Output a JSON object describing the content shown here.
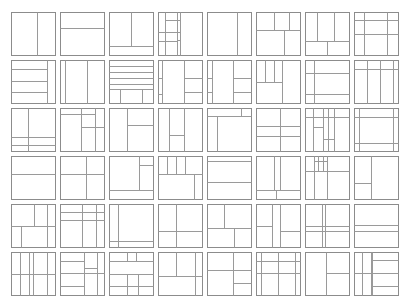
{
  "layout": {
    "cols": 8,
    "rows": 6,
    "origin_x": 11,
    "origin_y": 12,
    "pitch_x": 49,
    "pitch_y": 48,
    "tile_w": 44,
    "tile_h": 43
  },
  "style": {
    "line_color": "#9a9a9a",
    "border_color": "#8c8c8c",
    "background": "#ffffff"
  },
  "tiles": [
    {
      "lines": [
        [
          "v",
          0.58,
          0,
          1
        ]
      ]
    },
    {
      "lines": [
        [
          "h",
          0.38,
          0,
          1
        ]
      ]
    },
    {
      "lines": [
        [
          "v",
          0.5,
          0,
          0.78
        ],
        [
          "h",
          0.78,
          0,
          1
        ]
      ]
    },
    {
      "lines": [
        [
          "v",
          0.15,
          0,
          1
        ],
        [
          "v",
          0.43,
          0,
          1
        ],
        [
          "v",
          0.51,
          0,
          1
        ],
        [
          "h",
          0.18,
          0.15,
          0.51
        ],
        [
          "h",
          0.47,
          0,
          0.51
        ],
        [
          "h",
          0.68,
          0,
          0.43
        ],
        [
          "h",
          0.65,
          0.43,
          0.51
        ]
      ]
    },
    {
      "lines": [
        [
          "v",
          0.68,
          0,
          1
        ]
      ]
    },
    {
      "lines": [
        [
          "h",
          0.42,
          0,
          1
        ],
        [
          "v",
          0.4,
          0,
          0.42
        ],
        [
          "v",
          0.75,
          0,
          0.42
        ],
        [
          "v",
          0.63,
          0.42,
          1
        ]
      ]
    },
    {
      "lines": [
        [
          "v",
          0.28,
          0,
          0.68
        ],
        [
          "v",
          0.67,
          0,
          0.68
        ],
        [
          "h",
          0.68,
          0,
          1
        ],
        [
          "v",
          0.5,
          0.68,
          1
        ]
      ]
    },
    {
      "lines": [
        [
          "h",
          0.18,
          0,
          1
        ],
        [
          "h",
          0.52,
          0,
          1
        ],
        [
          "v",
          0.22,
          0,
          1
        ],
        [
          "v",
          0.74,
          0,
          1
        ]
      ]
    },
    {
      "lines": [
        [
          "h",
          0.22,
          0,
          0.82
        ],
        [
          "h",
          0.48,
          0,
          0.82
        ],
        [
          "h",
          0.75,
          0,
          0.82
        ],
        [
          "v",
          0.82,
          0,
          1
        ]
      ]
    },
    {
      "lines": [
        [
          "v",
          0.12,
          0,
          1
        ],
        [
          "v",
          0.62,
          0,
          1
        ]
      ]
    },
    {
      "lines": [
        [
          "h",
          0.14,
          0,
          1
        ],
        [
          "h",
          0.28,
          0,
          1
        ],
        [
          "h",
          0.42,
          0,
          1
        ],
        [
          "h",
          0.56,
          0,
          1
        ],
        [
          "h",
          0.68,
          0,
          1
        ],
        [
          "v",
          0.24,
          0.68,
          1
        ],
        [
          "v",
          0.76,
          0.68,
          1
        ]
      ]
    },
    {
      "lines": [
        [
          "v",
          0.1,
          0,
          1
        ],
        [
          "v",
          0.58,
          0,
          1
        ],
        [
          "h",
          0.42,
          0.58,
          1
        ],
        [
          "h",
          0.75,
          0.58,
          1
        ],
        [
          "h",
          0.78,
          0,
          0.1
        ],
        [
          "h",
          0.42,
          0,
          0.1
        ]
      ]
    },
    {
      "lines": [
        [
          "v",
          0.12,
          0,
          1
        ],
        [
          "v",
          0.58,
          0,
          1
        ],
        [
          "h",
          0.42,
          0.58,
          1
        ],
        [
          "h",
          0.75,
          0.58,
          1
        ],
        [
          "h",
          0.42,
          0,
          0.12
        ],
        [
          "h",
          0.75,
          0,
          0.12
        ]
      ]
    },
    {
      "lines": [
        [
          "v",
          0.2,
          0,
          0.5
        ],
        [
          "v",
          0.4,
          0,
          0.5
        ],
        [
          "v",
          0.6,
          0,
          0.5
        ],
        [
          "h",
          0.5,
          0,
          0.6
        ],
        [
          "v",
          0.6,
          0,
          1
        ]
      ]
    },
    {
      "lines": [
        [
          "v",
          0.2,
          0,
          1
        ],
        [
          "h",
          0.3,
          0,
          1
        ],
        [
          "h",
          0.78,
          0,
          1
        ]
      ]
    },
    {
      "lines": [
        [
          "v",
          0.3,
          0,
          1
        ],
        [
          "v",
          0.58,
          0,
          1
        ],
        [
          "v",
          0.88,
          0,
          1
        ],
        [
          "h",
          0.22,
          0,
          1
        ]
      ]
    },
    {
      "lines": [
        [
          "v",
          0.38,
          0,
          1
        ],
        [
          "h",
          0.68,
          0,
          1
        ],
        [
          "h",
          0.86,
          0,
          1
        ]
      ]
    },
    {
      "lines": [
        [
          "v",
          0.48,
          0,
          1
        ],
        [
          "v",
          0.8,
          0,
          1
        ],
        [
          "h",
          0.15,
          0,
          0.8
        ],
        [
          "h",
          0.45,
          0.48,
          1
        ]
      ]
    },
    {
      "lines": [
        [
          "v",
          0.4,
          0,
          1
        ],
        [
          "h",
          0.4,
          0.4,
          1
        ]
      ]
    },
    {
      "lines": [
        [
          "v",
          0.25,
          0,
          1
        ],
        [
          "v",
          0.6,
          0,
          1
        ],
        [
          "h",
          0.62,
          0.25,
          0.6
        ]
      ]
    },
    {
      "lines": [
        [
          "v",
          0.22,
          0.18,
          1
        ],
        [
          "h",
          0.18,
          0,
          1
        ],
        [
          "v",
          0.78,
          0,
          0.18
        ]
      ]
    },
    {
      "lines": [
        [
          "v",
          0.55,
          0,
          1
        ],
        [
          "h",
          0.42,
          0,
          1
        ],
        [
          "h",
          0.65,
          0,
          1
        ]
      ]
    },
    {
      "lines": [
        [
          "v",
          0.18,
          0,
          1
        ],
        [
          "v",
          0.4,
          0,
          1
        ],
        [
          "v",
          0.52,
          0,
          1
        ],
        [
          "v",
          0.66,
          0,
          1
        ],
        [
          "h",
          0.2,
          0,
          1
        ],
        [
          "h",
          0.45,
          0.18,
          0.4
        ],
        [
          "h",
          0.72,
          0.4,
          0.66
        ]
      ]
    },
    {
      "lines": [
        [
          "v",
          0.12,
          0,
          1
        ],
        [
          "v",
          0.88,
          0,
          1
        ],
        [
          "h",
          0.22,
          0,
          1
        ],
        [
          "h",
          0.82,
          0,
          1
        ]
      ]
    },
    {
      "lines": [
        [
          "h",
          0.42,
          0,
          1
        ]
      ]
    },
    {
      "lines": [
        [
          "v",
          0.6,
          0,
          1
        ],
        [
          "h",
          0.42,
          0,
          1
        ]
      ]
    },
    {
      "lines": [
        [
          "v",
          0.68,
          0,
          0.78
        ],
        [
          "h",
          0.2,
          0.68,
          1
        ],
        [
          "h",
          0.78,
          0,
          1
        ]
      ]
    },
    {
      "lines": [
        [
          "v",
          0.2,
          0,
          0.42
        ],
        [
          "v",
          0.42,
          0,
          0.42
        ],
        [
          "v",
          0.62,
          0,
          0.42
        ],
        [
          "h",
          0.42,
          0,
          1
        ],
        [
          "v",
          0.82,
          0.42,
          1
        ]
      ]
    },
    {
      "lines": [
        [
          "h",
          0.12,
          0,
          1
        ],
        [
          "h",
          0.6,
          0,
          1
        ]
      ]
    },
    {
      "lines": [
        [
          "v",
          0.4,
          0,
          0.78
        ],
        [
          "v",
          0.55,
          0,
          0.78
        ],
        [
          "h",
          0.78,
          0,
          1
        ],
        [
          "v",
          0.45,
          0.78,
          1
        ]
      ]
    },
    {
      "lines": [
        [
          "v",
          0.2,
          0,
          1
        ],
        [
          "v",
          0.5,
          0,
          1
        ],
        [
          "h",
          0.35,
          0,
          1
        ],
        [
          "h",
          0.12,
          0.2,
          0.5
        ],
        [
          "v",
          0.3,
          0,
          0.35
        ],
        [
          "v",
          0.42,
          0,
          0.35
        ]
      ]
    },
    {
      "lines": [
        [
          "v",
          0.38,
          0,
          1
        ],
        [
          "h",
          0.62,
          0,
          0.38
        ]
      ]
    },
    {
      "lines": [
        [
          "v",
          0.52,
          0,
          0.52
        ],
        [
          "v",
          0.82,
          0,
          1
        ],
        [
          "h",
          0.52,
          0,
          1
        ],
        [
          "v",
          0.22,
          0.52,
          1
        ]
      ]
    },
    {
      "lines": [
        [
          "h",
          0.18,
          0,
          1
        ],
        [
          "h",
          0.38,
          0,
          1
        ],
        [
          "v",
          0.5,
          0,
          1
        ],
        [
          "v",
          0.82,
          0,
          1
        ]
      ]
    },
    {
      "lines": [
        [
          "v",
          0.2,
          0,
          1
        ],
        [
          "h",
          0.85,
          0,
          1
        ]
      ]
    },
    {
      "lines": [
        [
          "v",
          0.42,
          0,
          1
        ],
        [
          "h",
          0.62,
          0,
          1
        ]
      ]
    },
    {
      "lines": [
        [
          "v",
          0.38,
          0,
          0.55
        ],
        [
          "h",
          0.55,
          0,
          1
        ],
        [
          "v",
          0.62,
          0.55,
          1
        ]
      ]
    },
    {
      "lines": [
        [
          "v",
          0.36,
          0,
          1
        ],
        [
          "h",
          0.52,
          0,
          0.36
        ],
        [
          "v",
          0.55,
          0,
          1
        ],
        [
          "h",
          0.62,
          0.55,
          1
        ]
      ]
    },
    {
      "lines": [
        [
          "v",
          0.38,
          0,
          1
        ],
        [
          "v",
          0.45,
          0,
          1
        ],
        [
          "h",
          0.52,
          0,
          1
        ],
        [
          "h",
          0.62,
          0,
          1
        ]
      ]
    },
    {
      "lines": [
        [
          "h",
          0.48,
          0,
          1
        ],
        [
          "h",
          0.62,
          0,
          1
        ]
      ]
    },
    {
      "lines": [
        [
          "v",
          0.2,
          0,
          1
        ],
        [
          "v",
          0.42,
          0,
          1
        ],
        [
          "v",
          0.5,
          0,
          1
        ],
        [
          "v",
          0.82,
          0,
          1
        ],
        [
          "h",
          0.52,
          0,
          1
        ]
      ]
    },
    {
      "lines": [
        [
          "h",
          0.2,
          0,
          0.55
        ],
        [
          "h",
          0.78,
          0,
          0.55
        ],
        [
          "v",
          0.55,
          0,
          1
        ],
        [
          "v",
          0.85,
          0,
          1
        ],
        [
          "h",
          0.38,
          0.55,
          0.85
        ],
        [
          "h",
          0.48,
          0,
          1
        ]
      ]
    },
    {
      "lines": [
        [
          "v",
          0.4,
          0,
          0.2
        ],
        [
          "v",
          0.62,
          0,
          0.2
        ],
        [
          "h",
          0.22,
          0,
          1
        ],
        [
          "h",
          0.52,
          0,
          1
        ],
        [
          "v",
          0.42,
          0.52,
          1
        ],
        [
          "v",
          0.65,
          0.52,
          1
        ],
        [
          "h",
          0.78,
          0,
          1
        ]
      ]
    },
    {
      "lines": [
        [
          "v",
          0.42,
          0,
          0.55
        ],
        [
          "v",
          0.85,
          0,
          1
        ],
        [
          "h",
          0.55,
          0,
          1
        ]
      ]
    },
    {
      "lines": [
        [
          "v",
          0.6,
          0,
          1
        ],
        [
          "h",
          0.42,
          0,
          1
        ],
        [
          "h",
          0.72,
          0.6,
          1
        ]
      ]
    },
    {
      "lines": [
        [
          "v",
          0.12,
          0,
          1
        ],
        [
          "v",
          0.5,
          0,
          1
        ],
        [
          "v",
          0.88,
          0,
          1
        ],
        [
          "h",
          0.2,
          0,
          1
        ],
        [
          "h",
          0.48,
          0,
          1
        ]
      ]
    },
    {
      "lines": [
        [
          "v",
          0.48,
          0,
          1
        ],
        [
          "h",
          0.48,
          0.48,
          1
        ]
      ]
    },
    {
      "lines": [
        [
          "v",
          0.18,
          0,
          1
        ],
        [
          "v",
          0.38,
          0,
          1
        ],
        [
          "v",
          0.4,
          0,
          1
        ],
        [
          "h",
          0.48,
          0,
          1
        ],
        [
          "h",
          0.18,
          0.4,
          1
        ],
        [
          "h",
          0.78,
          0.4,
          1
        ]
      ]
    }
  ]
}
